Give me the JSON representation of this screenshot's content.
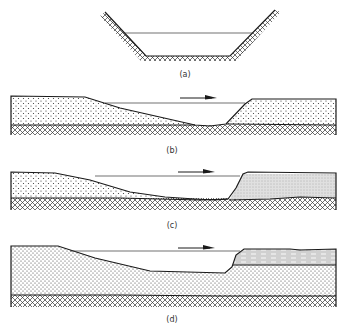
{
  "figure": {
    "panels": [
      {
        "id": "a",
        "label": "(a)",
        "description": "Trapezoidal channel cross-section lined with cross-hatched bedrock; horizontal water-surface line"
      },
      {
        "id": "b",
        "label": "(b)",
        "description": "Longitudinal section: stippled sediment over cross-hatched bedrock, scoured channel with flow arrow"
      },
      {
        "id": "c",
        "label": "(c)",
        "description": "Longitudinal section: stippled sediment upstream, finer gray deposit downstream of steep bank, over bedrock"
      },
      {
        "id": "d",
        "label": "(d)",
        "description": "Longitudinal section: thick stippled sediment, dashed clay layer capping downstream bank, over bedrock"
      }
    ],
    "flow_arrow": "right-arrow",
    "colors": {
      "ink": "#1a1a1a",
      "background": "#ffffff",
      "fine_deposit": "#c8c8c8"
    }
  }
}
